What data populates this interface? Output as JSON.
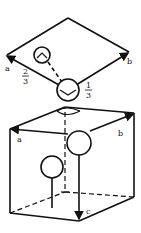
{
  "figure": {
    "top_panel": {
      "description": "Rhombus (2D cell projection) with two atoms",
      "axis_labels": {
        "a": "a",
        "b": "b"
      },
      "fractions": {
        "left": {
          "num": "2",
          "den": "3"
        },
        "right": {
          "num": "1",
          "den": "3"
        }
      }
    },
    "bottom_panel": {
      "description": "3D unit cell (cube) with atoms",
      "axis_labels": {
        "a": "a",
        "b": "b",
        "c": "c"
      }
    },
    "colors": {
      "line": "#111111",
      "background": "#ffffff"
    }
  }
}
